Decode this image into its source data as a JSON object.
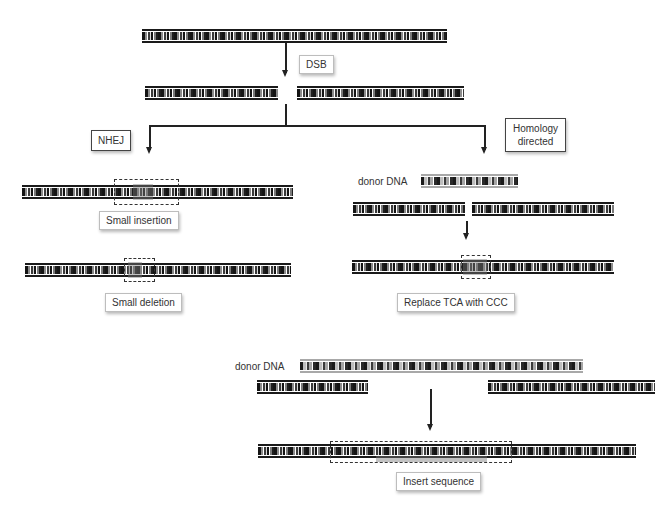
{
  "diagram": {
    "labels": {
      "dsb": "DSB",
      "nhej": "NHEJ",
      "homology_line1": "Homology",
      "homology_line2": "directed",
      "small_insertion": "Small insertion",
      "small_deletion": "Small deletion",
      "donor_dna_1": "donor DNA",
      "replace": "Replace TCA with CCC",
      "donor_dna_2": "donor DNA",
      "insert_sequence": "Insert sequence"
    },
    "colors": {
      "strand": "#1a1a1a",
      "donor_strand": "#a8a8a8",
      "highlight": "#787878",
      "box_border": "#444444"
    },
    "nodes": [
      {
        "id": "intact-dna",
        "type": "dna-strand"
      },
      {
        "id": "broken-dna",
        "type": "dna-strand-pair",
        "annotation": "DSB"
      },
      {
        "id": "nhej",
        "type": "pathway",
        "label": "NHEJ"
      },
      {
        "id": "hdr",
        "type": "pathway",
        "label": "Homology directed"
      },
      {
        "id": "insertion-result",
        "type": "dna-strand",
        "annotation": "Small insertion"
      },
      {
        "id": "deletion-result",
        "type": "dna-strand",
        "annotation": "Small deletion"
      },
      {
        "id": "replace-result",
        "type": "dna-strand",
        "annotation": "Replace TCA with CCC"
      },
      {
        "id": "insert-result",
        "type": "dna-strand",
        "annotation": "Insert sequence"
      }
    ]
  }
}
